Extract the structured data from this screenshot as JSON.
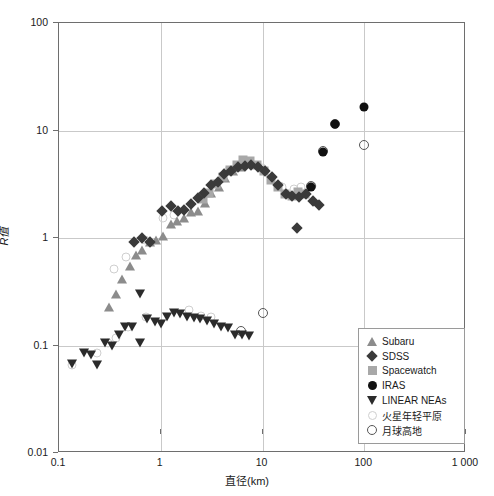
{
  "chart_data": {
    "type": "scatter",
    "title": "",
    "xlabel": "直径(km)",
    "ylabel": "R值",
    "xscale": "log",
    "yscale": "log",
    "xlim": [
      0.1,
      1000
    ],
    "ylim": [
      0.01,
      100
    ],
    "grid": true,
    "xticks": [
      0.1,
      1,
      10,
      100,
      1000
    ],
    "xtick_labels": [
      "0.1",
      "1",
      "10",
      "100",
      "1 000"
    ],
    "yticks": [
      0.01,
      0.1,
      1,
      10,
      100
    ],
    "ytick_labels": [
      "0.01",
      "0.1",
      "1",
      "10",
      "100"
    ],
    "legend_position": "lower-right",
    "series": [
      {
        "name": "Subaru",
        "marker": "triangle-up",
        "color": "#8c8c8c",
        "points": [
          [
            0.31,
            0.23
          ],
          [
            0.36,
            0.3
          ],
          [
            0.42,
            0.42
          ],
          [
            0.5,
            0.55
          ],
          [
            0.57,
            0.7
          ],
          [
            0.66,
            0.78
          ],
          [
            0.78,
            0.92
          ],
          [
            0.9,
            0.95
          ],
          [
            1.05,
            1.05
          ],
          [
            1.25,
            1.35
          ],
          [
            1.45,
            1.45
          ],
          [
            1.7,
            1.55
          ],
          [
            2.0,
            1.75
          ],
          [
            2.3,
            1.8
          ],
          [
            2.7,
            2.1
          ],
          [
            3.1,
            2.6
          ],
          [
            3.7,
            3.0
          ],
          [
            4.3,
            3.6
          ],
          [
            5.1,
            4.2
          ],
          [
            6.0,
            4.6
          ]
        ]
      },
      {
        "name": "SDSS",
        "marker": "diamond",
        "color": "#3a3a3a",
        "points": [
          [
            0.5,
            1.0
          ],
          [
            0.6,
            1.1
          ],
          [
            0.72,
            1.0
          ],
          [
            0.95,
            1.95
          ],
          [
            1.15,
            2.15
          ],
          [
            1.35,
            1.95
          ],
          [
            1.55,
            2.0
          ],
          [
            1.8,
            2.25
          ],
          [
            2.1,
            2.55
          ],
          [
            2.45,
            2.85
          ],
          [
            2.85,
            3.4
          ],
          [
            3.3,
            3.6
          ],
          [
            3.85,
            4.3
          ],
          [
            4.5,
            4.6
          ],
          [
            5.2,
            5.0
          ],
          [
            6.1,
            5.1
          ],
          [
            7.1,
            5.2
          ],
          [
            8.2,
            5.0
          ],
          [
            9.6,
            4.6
          ],
          [
            11.2,
            4.0
          ],
          [
            13.0,
            3.4
          ],
          [
            15.5,
            2.8
          ],
          [
            18.0,
            2.7
          ],
          [
            21.0,
            2.6
          ],
          [
            24.5,
            2.8
          ],
          [
            28.5,
            2.4
          ],
          [
            33.0,
            2.2
          ],
          [
            20.0,
            1.35
          ]
        ]
      },
      {
        "name": "Spacewatch",
        "marker": "square",
        "color": "#a8a8a8",
        "points": [
          [
            2.6,
            2.3
          ],
          [
            3.0,
            2.6
          ],
          [
            3.5,
            3.2
          ],
          [
            4.1,
            3.7
          ],
          [
            4.8,
            4.3
          ],
          [
            5.6,
            4.8
          ],
          [
            6.5,
            5.3
          ],
          [
            7.6,
            5.2
          ],
          [
            8.9,
            4.8
          ],
          [
            10.4,
            4.2
          ],
          [
            12.2,
            3.5
          ],
          [
            14.2,
            3.0
          ],
          [
            16.6,
            2.55
          ],
          [
            19.5,
            2.45
          ],
          [
            22.5,
            2.7
          ],
          [
            26.0,
            2.55
          ]
        ]
      },
      {
        "name": "IRAS",
        "marker": "circle",
        "color": "#111111",
        "points": [
          [
            30.0,
            3.0
          ],
          [
            39.0,
            6.3
          ],
          [
            52.0,
            11.5
          ],
          [
            100.0,
            16.5
          ]
        ]
      },
      {
        "name": "LINEAR NEAs",
        "marker": "triangle-down",
        "color": "#2b2b2b",
        "points": [
          [
            0.135,
            0.068
          ],
          [
            0.175,
            0.085
          ],
          [
            0.205,
            0.082
          ],
          [
            0.235,
            0.066
          ],
          [
            0.285,
            0.105
          ],
          [
            0.33,
            0.098
          ],
          [
            0.39,
            0.125
          ],
          [
            0.45,
            0.148
          ],
          [
            0.52,
            0.15
          ],
          [
            0.62,
            0.105
          ],
          [
            0.74,
            0.175
          ],
          [
            0.87,
            0.165
          ],
          [
            1.0,
            0.16
          ],
          [
            1.15,
            0.185
          ],
          [
            1.35,
            0.2
          ],
          [
            1.55,
            0.195
          ],
          [
            1.8,
            0.185
          ],
          [
            2.1,
            0.18
          ],
          [
            2.45,
            0.175
          ],
          [
            2.85,
            0.17
          ],
          [
            3.3,
            0.16
          ],
          [
            3.9,
            0.15
          ],
          [
            4.6,
            0.145
          ],
          [
            5.4,
            0.125
          ],
          [
            6.3,
            0.125
          ],
          [
            7.4,
            0.122
          ],
          [
            0.63,
            0.3
          ]
        ]
      },
      {
        "name": "火星年轻平原",
        "marker": "open-circle-light",
        "color": "#cfcfcf",
        "points": [
          [
            0.135,
            0.066
          ],
          [
            0.235,
            0.085
          ],
          [
            0.3,
            0.105
          ],
          [
            0.36,
            0.118
          ],
          [
            0.48,
            0.15
          ],
          [
            0.72,
            0.185
          ],
          [
            1.9,
            0.215
          ],
          [
            2.5,
            0.19
          ],
          [
            3.1,
            0.185
          ],
          [
            0.345,
            0.52
          ],
          [
            0.455,
            0.66
          ],
          [
            0.7,
            0.95
          ],
          [
            1.05,
            1.55
          ],
          [
            1.35,
            1.65
          ],
          [
            4.6,
            4.2
          ],
          [
            7.4,
            4.9
          ],
          [
            9.8,
            4.45
          ],
          [
            15.5,
            3.0
          ],
          [
            20.5,
            2.85
          ],
          [
            24.0,
            2.95
          ],
          [
            31.0,
            3.05
          ]
        ]
      },
      {
        "name": "月球高地",
        "marker": "open-circle-dark",
        "color": "#555555",
        "points": [
          [
            6.1,
            0.135
          ],
          [
            10.2,
            0.2
          ],
          [
            39.0,
            6.4
          ],
          [
            52.0,
            11.6
          ],
          [
            100.0,
            7.3
          ],
          [
            30.0,
            3.05
          ]
        ]
      }
    ]
  },
  "legend": {
    "items": [
      {
        "label": "Subaru",
        "marker": "triangle-up-icon"
      },
      {
        "label": "SDSS",
        "marker": "diamond-icon"
      },
      {
        "label": "Spacewatch",
        "marker": "square-icon"
      },
      {
        "label": "IRAS",
        "marker": "circle-icon"
      },
      {
        "label": "LINEAR NEAs",
        "marker": "triangle-down-icon"
      },
      {
        "label": "火星年轻平原",
        "marker": "open-circle-light-icon"
      },
      {
        "label": "月球高地",
        "marker": "open-circle-dark-icon"
      }
    ]
  }
}
